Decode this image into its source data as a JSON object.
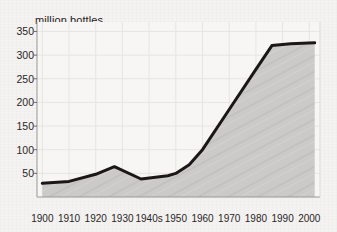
{
  "chart_data": {
    "type": "area",
    "title": "",
    "ylabel": "million bottles",
    "xlabel": "",
    "ylim": [
      0,
      370
    ],
    "xlim": [
      1898,
      2004
    ],
    "grid": true,
    "legend": "none",
    "y_ticks": [
      350,
      300,
      250,
      200,
      150,
      100,
      50
    ],
    "x_ticks": [
      "1900",
      "1910",
      "1920",
      "1930",
      "1940s",
      "1950",
      "1960",
      "1970",
      "1980",
      "1990",
      "2000"
    ],
    "x_tick_values": [
      1900,
      1910,
      1920,
      1930,
      1940,
      1950,
      1960,
      1970,
      1980,
      1990,
      2000
    ],
    "series": [
      {
        "name": "million bottles",
        "x": [
          1900,
          1910,
          1920,
          1927,
          1937,
          1947,
          1950,
          1955,
          1960,
          1970,
          1980,
          1986,
          1993,
          2002
        ],
        "values": [
          29,
          33,
          48,
          64,
          38,
          45,
          50,
          68,
          100,
          185,
          270,
          320,
          324,
          326
        ]
      }
    ],
    "line_color": "#1b1718",
    "fill_color": "#c9c8c6",
    "background_color": "#f4f3f1",
    "grid_color": "#e4e3e1"
  }
}
